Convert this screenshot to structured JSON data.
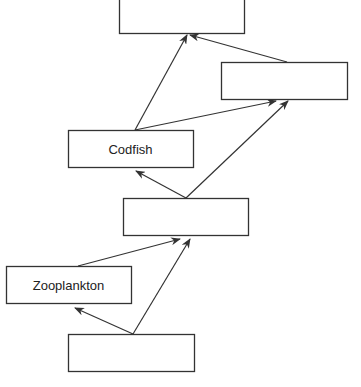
{
  "diagram": {
    "type": "food-web",
    "colors": {
      "stroke": "#333333",
      "background": "#ffffff",
      "text": "#222222"
    },
    "nodes": [
      {
        "id": "top",
        "label": "",
        "x": 119,
        "y": -2,
        "w": 125,
        "h": 35
      },
      {
        "id": "right",
        "label": "",
        "x": 221,
        "y": 62,
        "w": 126,
        "h": 37
      },
      {
        "id": "codfish",
        "label": "Codfish",
        "x": 68,
        "y": 130,
        "w": 125,
        "h": 37
      },
      {
        "id": "middle",
        "label": "",
        "x": 123,
        "y": 198,
        "w": 125,
        "h": 37
      },
      {
        "id": "zooplankton",
        "label": "Zooplankton",
        "x": 6,
        "y": 266,
        "w": 125,
        "h": 37
      },
      {
        "id": "bottom",
        "label": "",
        "x": 68,
        "y": 334,
        "w": 126,
        "h": 37
      }
    ],
    "edges": [
      {
        "from": "codfish",
        "to": "top",
        "x1": 135,
        "y1": 130,
        "x2": 187,
        "y2": 35
      },
      {
        "from": "right",
        "to": "top",
        "x1": 287,
        "y1": 62,
        "x2": 190,
        "y2": 35
      },
      {
        "from": "codfish",
        "to": "right",
        "x1": 135,
        "y1": 130,
        "x2": 276,
        "y2": 101
      },
      {
        "from": "middle",
        "to": "right",
        "x1": 186,
        "y1": 198,
        "x2": 288,
        "y2": 101
      },
      {
        "from": "middle",
        "to": "codfish",
        "x1": 186,
        "y1": 198,
        "x2": 136,
        "y2": 171
      },
      {
        "from": "zooplankton",
        "to": "middle",
        "x1": 78,
        "y1": 266,
        "x2": 180,
        "y2": 239
      },
      {
        "from": "bottom",
        "to": "middle",
        "x1": 133,
        "y1": 334,
        "x2": 190,
        "y2": 239
      },
      {
        "from": "bottom",
        "to": "zooplankton",
        "x1": 133,
        "y1": 334,
        "x2": 75,
        "y2": 308
      }
    ]
  }
}
